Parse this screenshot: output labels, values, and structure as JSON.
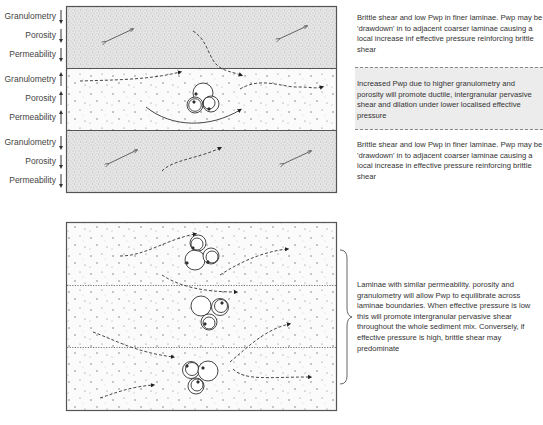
{
  "figure": {
    "top_panel": {
      "laminae": [
        {
          "id": "upper-fine",
          "texture": "dense-fine-stipple",
          "properties": [
            {
              "label": "Granulometry",
              "direction": "down"
            },
            {
              "label": "Porosity",
              "direction": "down"
            },
            {
              "label": "Permeability",
              "direction": "down"
            }
          ],
          "description": "Brittle shear and low Pwp in finer laminae. Pwp may be 'drawdown' in to adjacent coarser laminae causing a local increase inf effective pressure reinforcing brittle shear"
        },
        {
          "id": "middle-coarse",
          "texture": "sparse-coarse-dots",
          "properties": [
            {
              "label": "Granulometry",
              "direction": "up"
            },
            {
              "label": "Porosity",
              "direction": "up"
            },
            {
              "label": "Permeability",
              "direction": "up"
            }
          ],
          "description": "Increased Pwp due to higher granulometry and porosity will promote ductile, intergranular pervasive shear and dilation under lower localised effective pressure",
          "highlighted": true
        },
        {
          "id": "lower-fine",
          "texture": "dense-fine-stipple",
          "properties": [
            {
              "label": "Granulometry",
              "direction": "down"
            },
            {
              "label": "Porosity",
              "direction": "down"
            },
            {
              "label": "Permeability",
              "direction": "down"
            }
          ],
          "description": "Brittle shear and low Pwp in finer laminae. Pwp may be 'drawdown' in to adjacent coarser laminae causing a local increase in effective pressure reinforcing brittle shear"
        }
      ]
    },
    "bottom_panel": {
      "laminae_count": 3,
      "boundary_style": "dotted",
      "description": "Laminae with similar permeability. porosity and granulometry will allow Pwp to equilibrate across laminae boundaries. When effective pressure is low this will promote intergranular pervasive shear throughout the whole sediment mix. Conversely, if effective pressure is high, brittle shear may predominate"
    },
    "caption_partial": "(cut-off caption text at bottom edge)",
    "colors": {
      "border": "#555555",
      "stipple": "#9a9a9a",
      "highlight_box": "#ececec",
      "text": "#333333"
    }
  }
}
